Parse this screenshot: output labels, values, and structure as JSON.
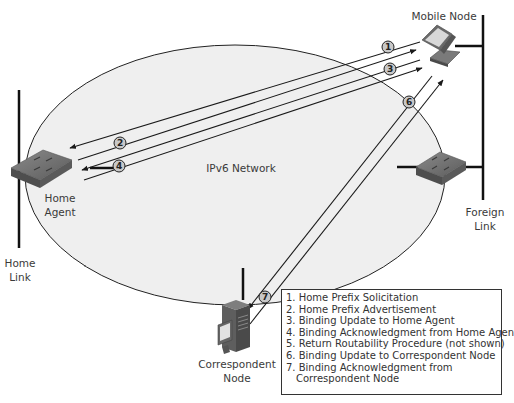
{
  "diagram": {
    "network_label": "IPv6 Network",
    "nodes": {
      "mobile_node": "Mobile Node",
      "home_agent": [
        "Home",
        "Agent"
      ],
      "home_link": [
        "Home",
        "Link"
      ],
      "foreign_link": [
        "Foreign",
        "Link"
      ],
      "correspondent_node": [
        "Correspondent",
        "Node"
      ]
    },
    "step_markers": [
      "1",
      "2",
      "3",
      "4",
      "6",
      "7"
    ],
    "legend": [
      "1. Home Prefix Solicitation",
      "2. Home Prefix Advertisement",
      "3. Binding Update to Home Agent",
      "4. Binding Acknowledgment from Home Agent",
      "5. Return Routability Procedure (not shown)",
      "6. Binding Update to Correspondent Node",
      "7. Binding Acknowledgment from",
      "Correspondent Node"
    ],
    "colors": {
      "network_fill": "#efefef",
      "line": "#1a1a1a",
      "device": "#6e6e6e"
    }
  }
}
